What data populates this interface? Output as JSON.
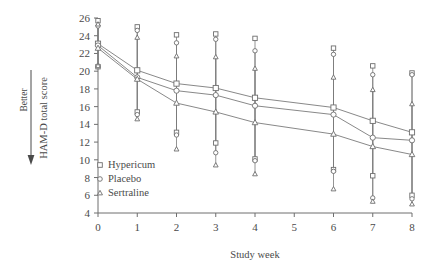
{
  "chart_data": {
    "type": "line",
    "title": "",
    "xlabel": "Study week",
    "ylabel": "HAM-D total score",
    "y_direction_annotation": "Better",
    "x": [
      0,
      1,
      2,
      3,
      4,
      6,
      7,
      8
    ],
    "xlim": [
      0,
      8
    ],
    "ylim": [
      4,
      26
    ],
    "xticks": [
      0,
      1,
      2,
      3,
      4,
      5,
      6,
      7,
      8
    ],
    "yticks": [
      4,
      6,
      8,
      10,
      12,
      14,
      16,
      18,
      20,
      22,
      24,
      26
    ],
    "grid": false,
    "legend_position": "inside-lower-left",
    "error_bars": "vertical ranges at each point",
    "series": [
      {
        "name": "Hypericum",
        "marker": "square",
        "values": [
          23.1,
          20.1,
          18.6,
          18.1,
          17.0,
          15.9,
          14.4,
          13.1
        ],
        "err_low": [
          20.5,
          15.4,
          13.1,
          11.9,
          10.1,
          8.9,
          8.2,
          6.0
        ],
        "err_high": [
          25.7,
          25.0,
          24.1,
          24.2,
          23.7,
          22.6,
          20.6,
          19.8
        ]
      },
      {
        "name": "Placebo",
        "marker": "circle",
        "values": [
          22.9,
          19.3,
          17.8,
          17.3,
          16.1,
          15.1,
          12.5,
          12.2
        ],
        "err_low": [
          20.6,
          15.1,
          12.8,
          10.8,
          9.9,
          8.7,
          5.7,
          5.6
        ],
        "err_high": [
          25.1,
          24.6,
          23.2,
          23.6,
          22.3,
          21.9,
          19.6,
          19.6
        ]
      },
      {
        "name": "Sertraline",
        "marker": "triangle",
        "values": [
          22.6,
          19.1,
          16.4,
          15.4,
          14.2,
          12.9,
          11.5,
          10.6
        ],
        "err_low": [
          20.6,
          14.6,
          11.2,
          9.4,
          8.4,
          6.7,
          5.3,
          5.0
        ],
        "err_high": [
          25.3,
          23.8,
          21.7,
          21.6,
          20.3,
          19.3,
          17.9,
          16.3
        ]
      }
    ]
  },
  "axes": {
    "x_title": "Study week",
    "y_title": "HAM-D total score",
    "better_label": "Better",
    "x_tick_labels": [
      "0",
      "1",
      "2",
      "3",
      "4",
      "5",
      "6",
      "7",
      "8"
    ],
    "y_tick_labels": [
      "4",
      "6",
      "8",
      "10",
      "12",
      "14",
      "16",
      "18",
      "20",
      "22",
      "24",
      "26"
    ]
  },
  "legend": {
    "items": [
      {
        "label": "Hypericum",
        "marker": "square"
      },
      {
        "label": "Placebo",
        "marker": "circle"
      },
      {
        "label": "Sertraline",
        "marker": "triangle"
      }
    ]
  },
  "colors": {
    "line": "#7a7a7a",
    "marker_stroke": "#6e6e6e",
    "marker_fill": "#ffffff",
    "axis": "#6e6e6e",
    "text": "#4a4a4a"
  }
}
